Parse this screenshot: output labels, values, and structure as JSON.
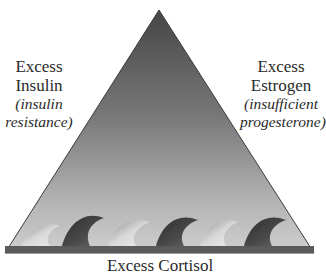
{
  "diagram": {
    "type": "triangle",
    "apex_label": "",
    "left_label": {
      "title_line1": "Excess",
      "title_line2": "Insulin",
      "sub_line1": "(insulin",
      "sub_line2": "resistance)"
    },
    "right_label": {
      "title_line1": "Excess",
      "title_line2": "Estrogen",
      "sub_line1": "(insufficient",
      "sub_line2": "progesterone)"
    },
    "bottom_label": {
      "text": "Excess Cortisol",
      "visibility": "partially clipped at bottom edge"
    },
    "waves": {
      "count": 6,
      "pattern": [
        "light",
        "dark",
        "light",
        "dark",
        "light",
        "dark"
      ]
    },
    "colors": {
      "triangle_top": "#4a4a4a",
      "triangle_bottom": "#c8c8c8",
      "triangle_edge": "#3a3a3a",
      "wave_dark": "#3c3c3c",
      "wave_light": "#bdbdbd",
      "base_band": "#5a5a5a",
      "text": "#2a2a2a"
    }
  }
}
